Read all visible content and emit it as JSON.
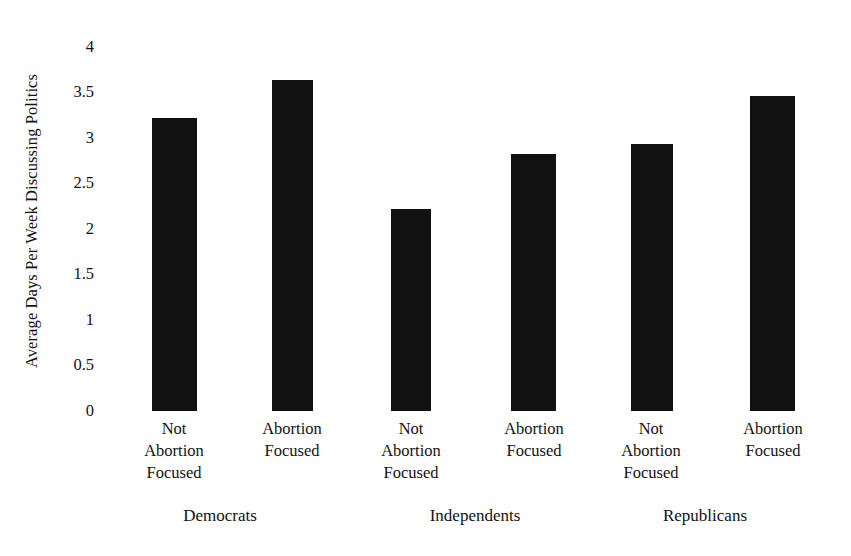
{
  "chart_data": {
    "type": "bar",
    "title": "",
    "subtitle": "",
    "xlabel": "",
    "ylabel": "Average Days Per Week Discussing Politics",
    "ylim": [
      0,
      4
    ],
    "ytick_labels": [
      "4",
      "3.5",
      "3",
      "2.5",
      "2",
      "1.5",
      "1",
      "0.5",
      "0"
    ],
    "ytick_values": [
      4,
      3.5,
      3,
      2.5,
      2,
      1.5,
      1,
      0.5,
      0
    ],
    "grid": false,
    "legend": "none",
    "bar_color": "#111111",
    "groups": [
      "Democrats",
      "Independents",
      "Republicans"
    ],
    "categories": [
      "Not\nAbortion\nFocused",
      "Abortion\nFocused",
      "Not\nAbortion\nFocused",
      "Abortion\nFocused",
      "Not\nAbortion\nFocused",
      "Abortion\nFocused"
    ],
    "values": [
      3.08,
      3.47,
      2.12,
      2.7,
      2.8,
      3.31
    ],
    "bars": [
      {
        "group": "Democrats",
        "category": "Not Abortion Focused",
        "value": 3.08
      },
      {
        "group": "Democrats",
        "category": "Abortion Focused",
        "value": 3.47
      },
      {
        "group": "Independents",
        "category": "Not Abortion Focused",
        "value": 2.12
      },
      {
        "group": "Independents",
        "category": "Abortion Focused",
        "value": 2.7
      },
      {
        "group": "Republicans",
        "category": "Not Abortion Focused",
        "value": 2.8
      },
      {
        "group": "Republicans",
        "category": "Abortion Focused",
        "value": 3.31
      }
    ]
  },
  "axis": {
    "y_title": "Average Days Per Week Discussing Politics",
    "ticks": [
      "4",
      "3.5",
      "3",
      "2.5",
      "2",
      "1.5",
      "1",
      "0.5",
      "0"
    ]
  },
  "labels": {
    "cat_0": "Not\nAbortion\nFocused",
    "cat_1": "Abortion\nFocused",
    "cat_2": "Not\nAbortion\nFocused",
    "cat_3": "Abortion\nFocused",
    "cat_4": "Not\nAbortion\nFocused",
    "cat_5": "Abortion\nFocused",
    "group_0": "Democrats",
    "group_1": "Independents",
    "group_2": "Republicans"
  }
}
